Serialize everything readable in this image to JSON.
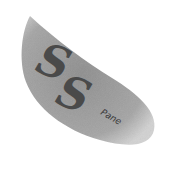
{
  "logo": {
    "primary_text": [
      "S",
      "S"
    ],
    "secondary_text": "Pane",
    "colors": {
      "shape_fill": "#9a9a9a",
      "shape_edge": "#c8c8c8",
      "text": "#4a4a4a",
      "background": "#ffffff"
    }
  }
}
